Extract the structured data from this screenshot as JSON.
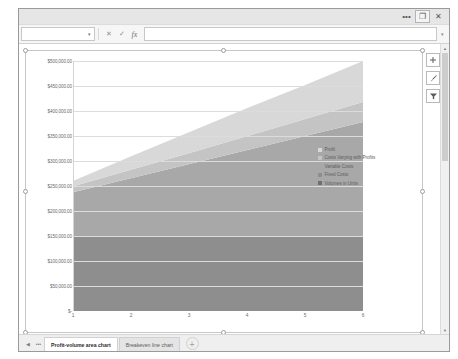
{
  "window": {
    "controls": [
      {
        "name": "window-menu-icon",
        "glyph": "•••"
      },
      {
        "name": "restore-icon",
        "glyph": "❐"
      },
      {
        "name": "close-icon",
        "glyph": "✕"
      }
    ]
  },
  "formula_bar": {
    "name_box_value": "",
    "name_box_caret": "▾",
    "cancel_glyph": "✕",
    "enter_glyph": "✓",
    "function_glyph": "fx",
    "formula_value": "",
    "expand_glyph": "▾"
  },
  "chart_tools": [
    {
      "name": "chart-elements-button",
      "glyph": "＋"
    },
    {
      "name": "chart-styles-button",
      "glyph": "✎"
    },
    {
      "name": "chart-filters-button",
      "glyph": "▽"
    }
  ],
  "scrollbar": {
    "up_glyph": "▲",
    "down_glyph": "▼"
  },
  "tabbar": {
    "nav_first_glyph": "◀",
    "nav_more_glyph": "•••",
    "add_sheet_glyph": "＋",
    "tabs": [
      {
        "label": "Profit-volume area chart",
        "active": true
      },
      {
        "label": "Breakeven line chart",
        "active": false
      }
    ]
  },
  "chart_data": {
    "type": "area",
    "title": "",
    "xlabel": "",
    "ylabel": "",
    "categories": [
      "1",
      "2",
      "3",
      "4",
      "5",
      "6"
    ],
    "x_tick_labels": [
      "1",
      "2",
      "3",
      "4",
      "5",
      "6"
    ],
    "y_tick_labels": [
      "$500,000.00",
      "$450,000.00",
      "$400,000.00",
      "$350,000.00",
      "$300,000.00",
      "$250,000.00",
      "$200,000.00",
      "$150,000.00",
      "$100,000.00",
      "$50,000.00",
      "$-"
    ],
    "y_tick_values": [
      500000,
      450000,
      400000,
      350000,
      300000,
      250000,
      200000,
      150000,
      100000,
      50000,
      0
    ],
    "ylim": [
      0,
      500000
    ],
    "grid": true,
    "stacked": true,
    "legend_position": "right",
    "series": [
      {
        "name": "Fixed Costs",
        "color": "#8e8e8e",
        "values": [
          150000,
          150000,
          150000,
          150000,
          150000,
          150000
        ]
      },
      {
        "name": "Variable Costs",
        "color": "#a8a8a8",
        "values": [
          88000,
          116000,
          144000,
          172000,
          200000,
          228000
        ]
      },
      {
        "name": "Costs Varying with Profits",
        "color": "#c4c4c4",
        "values": [
          12000,
          17000,
          22000,
          28000,
          34000,
          40000
        ]
      },
      {
        "name": "Profit",
        "color": "#d8d8d8",
        "values": [
          11000,
          27000,
          42000,
          56000,
          68000,
          82000
        ]
      },
      {
        "name": "Volumes in Units",
        "color": "#6f6f6f",
        "values": [
          0,
          0,
          0,
          0,
          0,
          0
        ]
      }
    ],
    "legend": [
      {
        "label": "Profit",
        "color": "#d8d8d8"
      },
      {
        "label": "Costs Varying with Profits",
        "color": "#c4c4c4"
      },
      {
        "label": "Variable Costs",
        "color": "#a8a8a8"
      },
      {
        "label": "Fixed Costs",
        "color": "#8e8e8e"
      },
      {
        "label": "Volumes in Units",
        "color": "#6f6f6f"
      }
    ]
  }
}
